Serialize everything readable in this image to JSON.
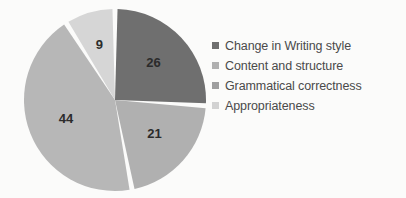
{
  "chart_data": {
    "type": "pie",
    "title": "",
    "subtitle": "",
    "xlabel": "",
    "ylabel": "",
    "grid": false,
    "legend_position": "right",
    "total": 100,
    "categories": [
      "Change in Writing style",
      "Content and structure",
      "Grammatical correctness",
      "Appropriateness"
    ],
    "values": [
      26,
      21,
      44,
      9
    ],
    "data_labels": [
      "26",
      "21",
      "44",
      "9"
    ],
    "colors": [
      "#6f6f6f",
      "#b0b0b0",
      "#b7b7b7",
      "#d6d6d6"
    ],
    "slices": [
      {
        "label": "Change in Writing style",
        "value": 26,
        "data_label": "26",
        "color": "#6f6f6f"
      },
      {
        "label": "Content and structure",
        "value": 21,
        "data_label": "21",
        "color": "#b0b0b0"
      },
      {
        "label": "Grammatical correctness",
        "value": 44,
        "data_label": "44",
        "color": "#b7b7b7"
      },
      {
        "label": "Appropriateness",
        "value": 9,
        "data_label": "9",
        "color": "#d6d6d6"
      }
    ]
  },
  "legend": {
    "items": [
      {
        "label": "Change in Writing style",
        "color": "#6f6f6f"
      },
      {
        "label": "Content and structure",
        "color": "#b0b0b0"
      },
      {
        "label": "Grammatical correctness",
        "color": "#9f9f9f"
      },
      {
        "label": "Appropriateness",
        "color": "#d2d2d2"
      }
    ]
  },
  "style": {
    "background": "#fbfbfa",
    "separator": "#ffffff",
    "label_text": "#2b2b2b",
    "legend_text": "#4a4a4a"
  }
}
